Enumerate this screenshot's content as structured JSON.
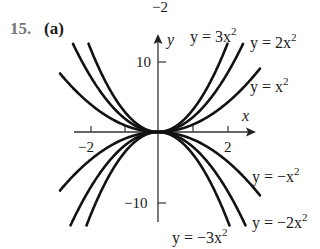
{
  "header": {
    "top_fragment": "−2",
    "problem_number": "15.",
    "part_label": "(a)"
  },
  "chart_data": {
    "type": "line",
    "title": "",
    "xlabel": "x",
    "ylabel": "y",
    "xlim": [
      -2.45,
      2.85
    ],
    "ylim": [
      -12.8,
      14
    ],
    "x_ticks": [
      -2,
      -1,
      1,
      2
    ],
    "x_tick_labels": [
      "−2",
      "2"
    ],
    "y_ticks": [
      10,
      -10
    ],
    "y_tick_labels": [
      "10",
      "−10"
    ],
    "grid": false,
    "legend": "inline labels",
    "series": [
      {
        "name": "y = 3x^2",
        "coef": 3,
        "label": "y = 3x",
        "sup": "2"
      },
      {
        "name": "y = 2x^2",
        "coef": 2,
        "label": "y = 2x",
        "sup": "2"
      },
      {
        "name": "y = x^2",
        "coef": 1,
        "label": "y = x",
        "sup": "2"
      },
      {
        "name": "y = -x^2",
        "coef": -1,
        "label": "y = −x",
        "sup": "2"
      },
      {
        "name": "y = -2x^2",
        "coef": -2,
        "label": "y = −2x",
        "sup": "2"
      },
      {
        "name": "y = -3x^2",
        "coef": -3,
        "label": "y = −3x",
        "sup": "2"
      }
    ]
  },
  "style": {
    "curve_color": "#111111",
    "axis_color": "#333333",
    "number_color": "#777777"
  }
}
